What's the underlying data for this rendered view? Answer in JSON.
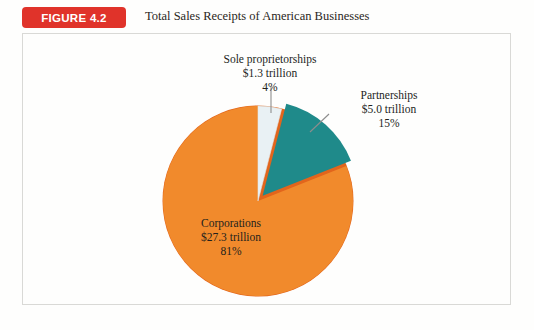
{
  "figure": {
    "badge": "FIGURE 4.2",
    "title": "Total Sales Receipts of American Businesses",
    "badge_color": "#e0332a",
    "panel_border_color": "#d9d9d6",
    "background_color": "#fefefd"
  },
  "chart_data": {
    "type": "pie",
    "title": "Total Sales Receipts of American Businesses",
    "unit": "trillion USD",
    "start_angle_deg": 0,
    "direction": "clockwise",
    "legend": "none",
    "grid": false,
    "categories": [
      "Sole proprietorships",
      "Partnerships",
      "Corporations"
    ],
    "values": [
      1.3,
      5.0,
      27.3
    ],
    "percentages": [
      4,
      15,
      81
    ],
    "colors": [
      "#e9f1f4",
      "#1f8a8a",
      "#f18a2c"
    ],
    "exploded": [
      false,
      true,
      false
    ],
    "slices": [
      {
        "name": "Sole proprietorships",
        "value": 1.3,
        "value_label": "$1.3 trillion",
        "percent": 4,
        "percent_label": "4%",
        "color": "#e9f1f4",
        "leader": "vertical"
      },
      {
        "name": "Partnerships",
        "value": 5.0,
        "value_label": "$5.0 trillion",
        "percent": 15,
        "percent_label": "15%",
        "color": "#1f8a8a",
        "leader": "diagonal"
      },
      {
        "name": "Corporations",
        "value": 27.3,
        "value_label": "$27.3 trillion",
        "percent": 81,
        "percent_label": "81%",
        "color": "#f18a2c",
        "leader": "none"
      }
    ]
  },
  "callouts": {
    "sole": {
      "name": "Sole proprietorships",
      "value": "$1.3 trillion",
      "percent": "4%"
    },
    "partnerships": {
      "name": "Partnerships",
      "value": "$5.0 trillion",
      "percent": "15%"
    },
    "corporations": {
      "name": "Corporations",
      "value": "$27.3 trillion",
      "percent": "81%"
    }
  }
}
